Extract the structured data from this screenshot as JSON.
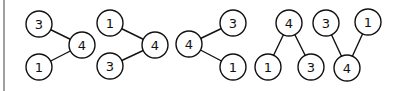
{
  "diagram": {
    "type": "tree-set",
    "colors": {
      "stroke": "#111111",
      "fill": "#ffffff",
      "left_rule": "#a0a0a0"
    },
    "node_radius": 13,
    "graphs": [
      {
        "nodes": [
          {
            "id": "a3",
            "label": "3",
            "x": 39,
            "y": 24
          },
          {
            "id": "a4",
            "label": "4",
            "x": 82,
            "y": 45
          },
          {
            "id": "a1",
            "label": "1",
            "x": 39,
            "y": 67
          }
        ],
        "edges": [
          [
            "a3",
            "a4"
          ],
          [
            "a1",
            "a4"
          ]
        ]
      },
      {
        "nodes": [
          {
            "id": "b1",
            "label": "1",
            "x": 110,
            "y": 23
          },
          {
            "id": "b4",
            "label": "4",
            "x": 155,
            "y": 45
          },
          {
            "id": "b3",
            "label": "3",
            "x": 110,
            "y": 66
          }
        ],
        "edges": [
          [
            "b1",
            "b4"
          ],
          [
            "b3",
            "b4"
          ]
        ]
      },
      {
        "nodes": [
          {
            "id": "c4",
            "label": "4",
            "x": 189,
            "y": 44
          },
          {
            "id": "c3",
            "label": "3",
            "x": 233,
            "y": 23
          },
          {
            "id": "c1",
            "label": "1",
            "x": 233,
            "y": 67
          }
        ],
        "edges": [
          [
            "c4",
            "c3"
          ],
          [
            "c4",
            "c1"
          ]
        ]
      },
      {
        "nodes": [
          {
            "id": "d4",
            "label": "4",
            "x": 289,
            "y": 23
          },
          {
            "id": "d1",
            "label": "1",
            "x": 268,
            "y": 67
          },
          {
            "id": "d3",
            "label": "3",
            "x": 311,
            "y": 67
          }
        ],
        "edges": [
          [
            "d4",
            "d1"
          ],
          [
            "d4",
            "d3"
          ]
        ]
      },
      {
        "nodes": [
          {
            "id": "e3",
            "label": "3",
            "x": 326,
            "y": 23
          },
          {
            "id": "e4",
            "label": "4",
            "x": 347,
            "y": 68
          },
          {
            "id": "e1",
            "label": "1",
            "x": 368,
            "y": 22
          }
        ],
        "edges": [
          [
            "e3",
            "e4"
          ],
          [
            "e1",
            "e4"
          ]
        ]
      }
    ]
  }
}
